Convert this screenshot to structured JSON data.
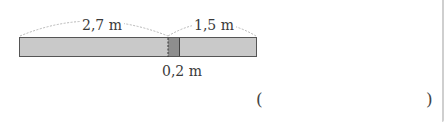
{
  "diagram": {
    "segments": {
      "left_length": "2,7 m",
      "right_length": "1,5 m",
      "overlap_length": "0,2 m"
    },
    "colors": {
      "bar_fill": "#c9c9c9",
      "overlap_fill": "#8e8e8e",
      "bar_stroke": "#555555",
      "arc_stroke": "#b5b5b5"
    }
  },
  "answer": {
    "open_paren": "(",
    "close_paren": ")",
    "value": ""
  }
}
